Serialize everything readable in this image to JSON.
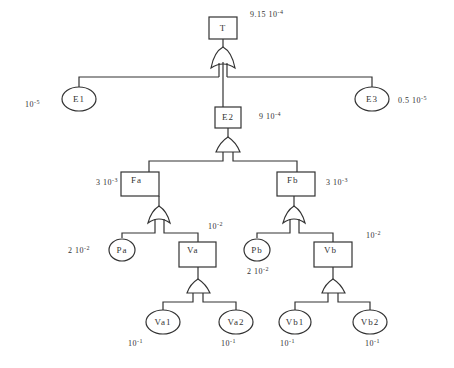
{
  "diagram": {
    "type": "fault-tree",
    "nodes": {
      "T": {
        "label": "T",
        "kind": "event-box",
        "gate": "OR",
        "prob_mantissa": "9.15 10",
        "prob_exp": "-4"
      },
      "E1": {
        "label": "E1",
        "kind": "basic-event",
        "prob_mantissa": "10",
        "prob_exp": "-5"
      },
      "E2": {
        "label": "E2",
        "kind": "event-box",
        "gate": "AND",
        "prob_mantissa": "9 10",
        "prob_exp": "-4"
      },
      "E3": {
        "label": "E3",
        "kind": "basic-event",
        "prob_mantissa": "0.5 10",
        "prob_exp": "-5"
      },
      "Fa": {
        "label": "Fa",
        "kind": "event-box",
        "gate": "OR",
        "prob_mantissa": "3 10",
        "prob_exp": "-3"
      },
      "Fb": {
        "label": "Fb",
        "kind": "event-box",
        "gate": "OR",
        "prob_mantissa": "3 10",
        "prob_exp": "-3"
      },
      "Pa": {
        "label": "Pa",
        "kind": "basic-event",
        "prob_mantissa": "2 10",
        "prob_exp": "-2"
      },
      "Va": {
        "label": "Va",
        "kind": "event-box",
        "gate": "AND",
        "prob_mantissa": "10",
        "prob_exp": "-2"
      },
      "Pb": {
        "label": "Pb",
        "kind": "basic-event",
        "prob_mantissa": "2 10",
        "prob_exp": "-2"
      },
      "Vb": {
        "label": "Vb",
        "kind": "event-box",
        "gate": "AND",
        "prob_mantissa": "10",
        "prob_exp": "-2"
      },
      "Va1": {
        "label": "Va1",
        "kind": "basic-event",
        "prob_mantissa": "10",
        "prob_exp": "-1"
      },
      "Va2": {
        "label": "Va2",
        "kind": "basic-event",
        "prob_mantissa": "10",
        "prob_exp": "-1"
      },
      "Vb1": {
        "label": "Vb1",
        "kind": "basic-event",
        "prob_mantissa": "10",
        "prob_exp": "-1"
      },
      "Vb2": {
        "label": "Vb2",
        "kind": "basic-event",
        "prob_mantissa": "10",
        "prob_exp": "-1"
      }
    },
    "edges": [
      [
        "T",
        "E1"
      ],
      [
        "T",
        "E2"
      ],
      [
        "T",
        "E3"
      ],
      [
        "E2",
        "Fa"
      ],
      [
        "E2",
        "Fb"
      ],
      [
        "Fa",
        "Pa"
      ],
      [
        "Fa",
        "Va"
      ],
      [
        "Fb",
        "Pb"
      ],
      [
        "Fb",
        "Vb"
      ],
      [
        "Va",
        "Va1"
      ],
      [
        "Va",
        "Va2"
      ],
      [
        "Vb",
        "Vb1"
      ],
      [
        "Vb",
        "Vb2"
      ]
    ],
    "colors": {
      "stroke": "#333333",
      "background": "#ffffff"
    }
  }
}
